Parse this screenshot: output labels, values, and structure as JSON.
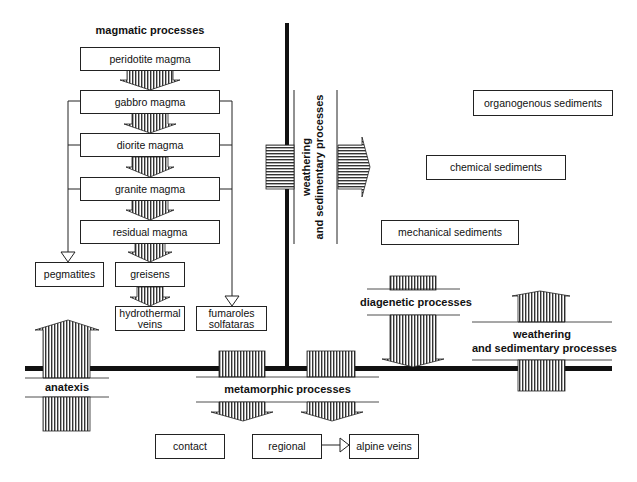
{
  "diagram": {
    "magmatic": {
      "title": "magmatic processes",
      "sequence": [
        {
          "id": "peridotite",
          "label": "peridotite magma"
        },
        {
          "id": "gabbro",
          "label": "gabbro magma"
        },
        {
          "id": "diorite",
          "label": "diorite magma"
        },
        {
          "id": "granite",
          "label": "granite magma"
        },
        {
          "id": "residual",
          "label": "residual magma"
        }
      ],
      "products": {
        "pegmatites": "pegmatites",
        "greisens": "greisens",
        "hydrothermal_1": "hydrothermal",
        "hydrothermal_2": "veins",
        "fumaroles_1": "fumaroles",
        "fumaroles_2": "solfataras"
      }
    },
    "sedimentary": {
      "vertical_label_1": "weathering",
      "vertical_label_2": "and sedimentary processes",
      "products": {
        "organogenous": "organogenous  sediments",
        "chemical": "chemical  sediments",
        "mechanical": "mechanical  sediments"
      }
    },
    "diagenetic": {
      "label": "diagenetic processes"
    },
    "weathering_right": {
      "line1": "weathering",
      "line2": "and sedimentary processes"
    },
    "anatexis": {
      "label": "anatexis"
    },
    "metamorphic": {
      "label": "metamorphic processes",
      "products": {
        "contact": "contact",
        "regional": "regional",
        "alpine": "alpine veins"
      }
    }
  }
}
